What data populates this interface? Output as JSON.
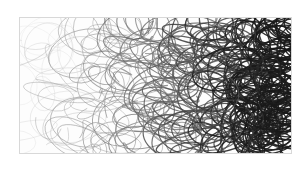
{
  "artwork": {
    "kind": "scribble-drawing",
    "description": "Abstract looping pen scribbles, light grey on the left growing dense and dark on the right",
    "frame": {
      "x": 19,
      "y": 17,
      "width": 271,
      "height": 135,
      "border_color": "#d8d8d8"
    },
    "colors": {
      "light": "#c8c8c8",
      "mid": "#7a7a7a",
      "dark": "#1e1e1e",
      "background": "#fdfdfd"
    }
  }
}
